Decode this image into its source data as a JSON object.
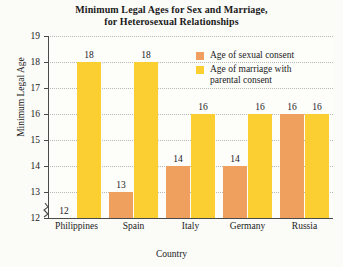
{
  "chart_data": {
    "type": "bar",
    "title": "Minimum Legal Ages for Sex and Marriage, for Heterosexual Relationships",
    "title_lines": [
      "Minimum Legal Ages for Sex and Marriage,",
      "for Heterosexual Relationships"
    ],
    "xlabel": "Country",
    "ylabel": "Minimum Legal Age",
    "categories": [
      "Philippines",
      "Spain",
      "Italy",
      "Germany",
      "Russia"
    ],
    "series": [
      {
        "name": "Age of sexual consent",
        "color": "#f0a05e",
        "values": [
          12,
          13,
          14,
          14,
          16
        ]
      },
      {
        "name": "Age of marriage with parental consent",
        "color": "#fbcf31",
        "values": [
          18,
          18,
          16,
          16,
          16
        ]
      }
    ],
    "ylim": [
      12,
      19
    ],
    "yticks": [
      12,
      13,
      14,
      15,
      16,
      17,
      18,
      19
    ],
    "ytick_labels": [
      "12",
      "13",
      "14",
      "15",
      "16",
      "17",
      "18",
      "19"
    ],
    "grid": "horizontal-dotted",
    "axis_break": true,
    "legend_position": "top-right",
    "legend": [
      {
        "label": "Age of sexual consent",
        "lines": [
          "Age of sexual consent"
        ],
        "color": "#f0a05e"
      },
      {
        "label": "Age of marriage with parental consent",
        "lines": [
          "Age of marriage with",
          "parental consent"
        ],
        "color": "#fbcf31"
      }
    ]
  }
}
